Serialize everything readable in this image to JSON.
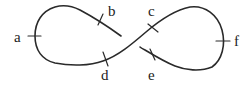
{
  "diagram": {
    "type": "knot-diagram",
    "stroke_color": "#2a2a2a",
    "labels": [
      {
        "id": "a",
        "text": "a"
      },
      {
        "id": "b",
        "text": "b"
      },
      {
        "id": "c",
        "text": "c"
      },
      {
        "id": "d",
        "text": "d"
      },
      {
        "id": "e",
        "text": "e"
      },
      {
        "id": "f",
        "text": "f"
      }
    ]
  }
}
